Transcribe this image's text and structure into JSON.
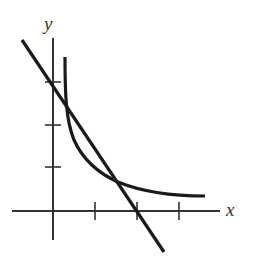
{
  "diagram": {
    "type": "graph-sketch",
    "axes": {
      "x_label": "x",
      "y_label": "y",
      "x_ticks": 3,
      "y_ticks": 3
    },
    "curves": [
      {
        "name": "line",
        "kind": "straight line, negative slope"
      },
      {
        "name": "curve",
        "kind": "decreasing convex curve approaching horizontal asymptote"
      }
    ],
    "colors": {
      "ink": "#1a1a1a",
      "axis": "#333333"
    }
  }
}
